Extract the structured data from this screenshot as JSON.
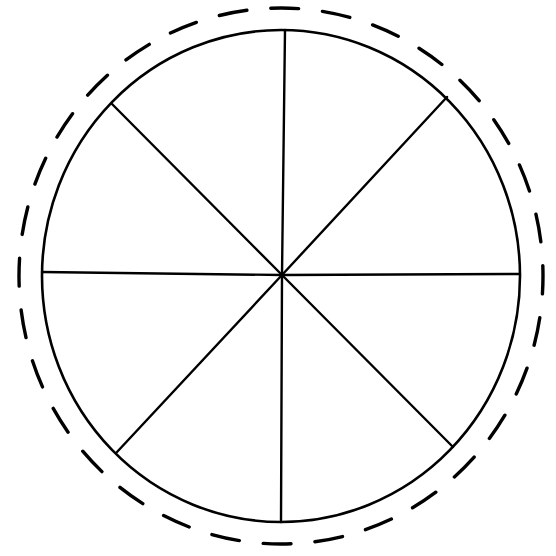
{
  "diagram": {
    "type": "segmented-circle",
    "segments": 8,
    "center": {
      "x": 282,
      "y": 275
    },
    "inner_circle": {
      "cx": 281,
      "cy": 276,
      "rx": 239,
      "ry": 246,
      "stroke": "#000000",
      "stroke_width": 2.6
    },
    "outer_dashed_circle": {
      "cx": 281,
      "cy": 276,
      "rx": 262,
      "ry": 268,
      "stroke": "#000000",
      "stroke_width": 3.4,
      "dash": 28,
      "gap": 24
    },
    "spokes": [
      {
        "name": "north",
        "x2": 285,
        "y2": 30
      },
      {
        "name": "north-east",
        "x2": 447,
        "y2": 97
      },
      {
        "name": "east",
        "x2": 520,
        "y2": 274
      },
      {
        "name": "south-east",
        "x2": 453,
        "y2": 447
      },
      {
        "name": "south",
        "x2": 281,
        "y2": 522
      },
      {
        "name": "south-west",
        "x2": 117,
        "y2": 452
      },
      {
        "name": "west",
        "x2": 42,
        "y2": 272
      },
      {
        "name": "north-west",
        "x2": 112,
        "y2": 104
      }
    ],
    "line_color": "#000000",
    "background": "#ffffff"
  }
}
